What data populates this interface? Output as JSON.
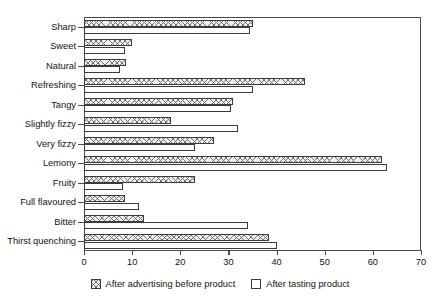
{
  "chart_data": {
    "type": "bar",
    "orientation": "horizontal",
    "title": "",
    "xlabel": "",
    "ylabel": "",
    "xlim": [
      0,
      70
    ],
    "xticks": [
      0,
      10,
      20,
      30,
      40,
      50,
      60,
      70
    ],
    "grid": false,
    "legend_position": "bottom",
    "categories": [
      "Sharp",
      "Sweet",
      "Natural",
      "Refreshing",
      "Tangy",
      "Slightly fizzy",
      "Very fizzy",
      "Lemony",
      "Fruity",
      "Full flavoured",
      "Bitter",
      "Thirst quenching"
    ],
    "series": [
      {
        "name": "After advertising before product",
        "pattern": "cross-hatch",
        "values": [
          35,
          10,
          8.7,
          46,
          31,
          18,
          27,
          62,
          23,
          8.5,
          12.5,
          38.5
        ]
      },
      {
        "name": "After tasting product",
        "pattern": "solid-white",
        "values": [
          34.5,
          8.5,
          7.5,
          35,
          30.5,
          32,
          23,
          63,
          8,
          11.5,
          34,
          40
        ]
      }
    ]
  },
  "legend": {
    "entries": [
      {
        "label": "After advertising before product"
      },
      {
        "label": "After tasting product"
      }
    ]
  }
}
